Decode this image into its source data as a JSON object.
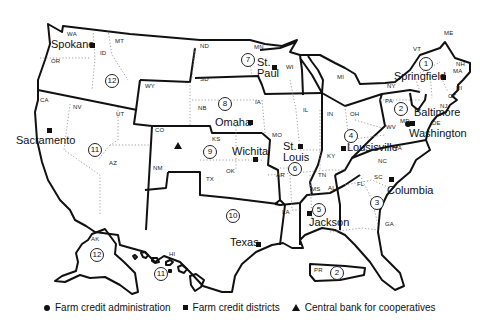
{
  "map": {
    "title": "Farm Credit System districts of the United States",
    "states": [
      "WA",
      "OR",
      "ID",
      "MT",
      "CA",
      "NV",
      "UT",
      "AZ",
      "WY",
      "CO",
      "NM",
      "ND",
      "SD",
      "NB",
      "KS",
      "OK",
      "TX",
      "MN",
      "IA",
      "MO",
      "AR",
      "LA",
      "WI",
      "IL",
      "MI",
      "IN",
      "OH",
      "KY",
      "TN",
      "MS",
      "AL",
      "GA",
      "FL",
      "SC",
      "NC",
      "VA",
      "WV",
      "MD",
      "DE",
      "PA",
      "NY",
      "NJ",
      "CT",
      "RI",
      "MA",
      "VT",
      "NH",
      "ME",
      "AK",
      "HI",
      "PR"
    ],
    "districts": [
      {
        "number": "1",
        "label": "①",
        "hq": "Springfield"
      },
      {
        "number": "2",
        "label": "②",
        "hq": "Baltimore"
      },
      {
        "number": "3",
        "label": "③",
        "hq": "Columbia"
      },
      {
        "number": "4",
        "label": "④",
        "hq": "Lousisville"
      },
      {
        "number": "5",
        "label": "⑤",
        "hq": "Jackson"
      },
      {
        "number": "6",
        "label": "⑥",
        "hq": "St. Louis"
      },
      {
        "number": "7",
        "label": "⑦",
        "hq": "St. Paul"
      },
      {
        "number": "8",
        "label": "⑧",
        "hq": "Omaha"
      },
      {
        "number": "9",
        "label": "⑨",
        "hq": "Wichita"
      },
      {
        "number": "10",
        "label": "⑩",
        "hq": "Texas"
      },
      {
        "number": "11",
        "label": "⑪",
        "hq": "Sacramento"
      },
      {
        "number": "12",
        "label": "⑫",
        "hq": "Spokane"
      }
    ],
    "extra_district_labels": {
      "ak": "⑫",
      "hi": "⑪",
      "pr": "②"
    },
    "cities": {
      "spokane": "Spokane",
      "sacramento": "Sacramento",
      "st_paul_1": "St.",
      "st_paul_2": "Paul",
      "omaha": "Omaha",
      "wichita": "Wichita",
      "st_louis_1": "St.",
      "st_louis_2": "Louis",
      "texas": "Texas",
      "jackson": "Jackson",
      "louisville": "Lousisville",
      "columbia": "Columbia",
      "springfield": "Springfield",
      "baltimore": "Baltimore",
      "washington": "Washington"
    },
    "special_markers": {
      "washington": "Farm credit administration",
      "colorado_triangle": "Central bank for cooperatives"
    }
  },
  "legend": {
    "items": [
      {
        "symbol": "circle",
        "label": "Farm credit administration"
      },
      {
        "symbol": "square",
        "label": "Farm credit districts"
      },
      {
        "symbol": "triangle",
        "label": "Central bank for cooperatives"
      }
    ]
  }
}
